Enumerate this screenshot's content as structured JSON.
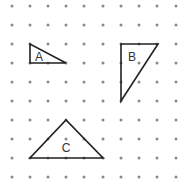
{
  "diagram": {
    "type": "dot-grid-triangles",
    "grid": {
      "columns_x": [
        12,
        30,
        48,
        66,
        84,
        103,
        121,
        139,
        157,
        176
      ],
      "rows_y": [
        6,
        25,
        44,
        63,
        82,
        101,
        120,
        139,
        158,
        177
      ],
      "dot_color": "#8a8a8a",
      "dot_radius": 1.5
    },
    "shapes": [
      {
        "label": "A",
        "points": [
          [
            30,
            44
          ],
          [
            30,
            63
          ],
          [
            66,
            63
          ]
        ],
        "label_pos": [
          39,
          61
        ]
      },
      {
        "label": "B",
        "points": [
          [
            121,
            44
          ],
          [
            158,
            44
          ],
          [
            121,
            101
          ]
        ],
        "label_pos": [
          132,
          61
        ]
      },
      {
        "label": "C",
        "points": [
          [
            30,
            158
          ],
          [
            103,
            158
          ],
          [
            66,
            120
          ]
        ],
        "label_pos": [
          66,
          152
        ]
      }
    ],
    "stroke_color": "#222222"
  }
}
